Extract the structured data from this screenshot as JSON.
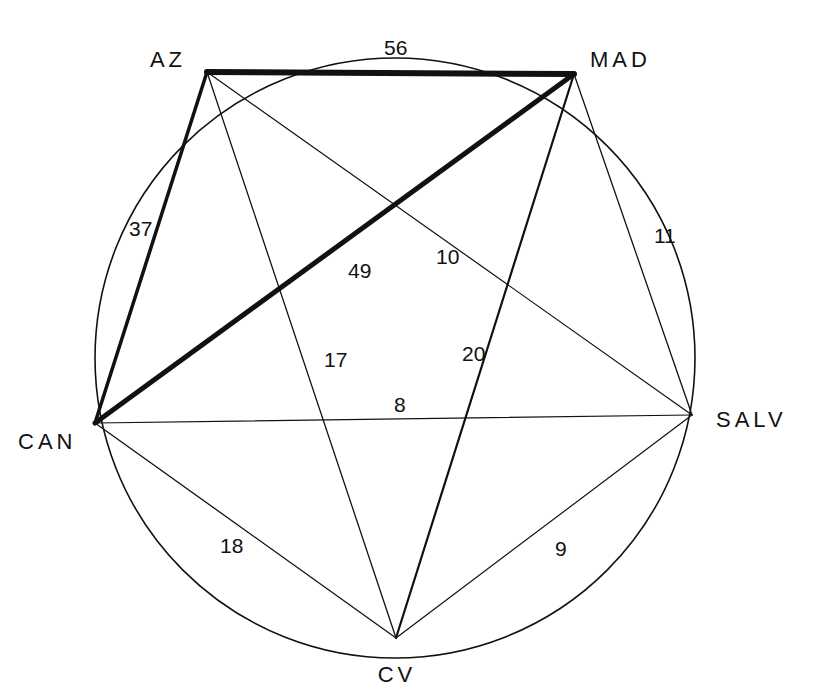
{
  "diagram": {
    "type": "weighted-complete-graph",
    "circle": {
      "cx": 395,
      "cy": 358,
      "r": 300
    },
    "nodes": [
      {
        "id": "AZ",
        "label": "AZ",
        "x": 207,
        "y": 72,
        "lx": 186,
        "ly": 67,
        "anchor": "end"
      },
      {
        "id": "MAD",
        "label": "MAD",
        "x": 574,
        "y": 74,
        "lx": 590,
        "ly": 67,
        "anchor": "start"
      },
      {
        "id": "CAN",
        "label": "CAN",
        "x": 95,
        "y": 423,
        "lx": 18,
        "ly": 449,
        "anchor": "start"
      },
      {
        "id": "SALV",
        "label": "SALV",
        "x": 692,
        "y": 415,
        "lx": 716,
        "ly": 427,
        "anchor": "start"
      },
      {
        "id": "CV",
        "label": "CV",
        "x": 396,
        "y": 638,
        "lx": 397,
        "ly": 682,
        "anchor": "middle"
      }
    ],
    "edges": [
      {
        "from": "AZ",
        "to": "MAD",
        "weight": "56",
        "width": 6,
        "lx": 384,
        "ly": 55
      },
      {
        "from": "MAD",
        "to": "CAN",
        "weight": "49",
        "width": 5,
        "lx": 348,
        "ly": 278
      },
      {
        "from": "AZ",
        "to": "CAN",
        "weight": "37",
        "width": 3.5,
        "lx": 129,
        "ly": 236
      },
      {
        "from": "MAD",
        "to": "CV",
        "weight": "20",
        "width": 2.2,
        "lx": 462,
        "ly": 361
      },
      {
        "from": "CAN",
        "to": "CV",
        "weight": "18",
        "width": 1.3,
        "lx": 220,
        "ly": 553
      },
      {
        "from": "AZ",
        "to": "CV",
        "weight": "17",
        "width": 1.3,
        "lx": 324,
        "ly": 367
      },
      {
        "from": "MAD",
        "to": "SALV",
        "weight": "11",
        "width": 1.3,
        "lx": 654,
        "ly": 243
      },
      {
        "from": "AZ",
        "to": "SALV",
        "weight": "10",
        "width": 1.2,
        "lx": 436,
        "ly": 264
      },
      {
        "from": "SALV",
        "to": "CV",
        "weight": "9",
        "width": 1.2,
        "lx": 555,
        "ly": 556
      },
      {
        "from": "CAN",
        "to": "SALV",
        "weight": "8",
        "width": 1.2,
        "lx": 394,
        "ly": 412
      }
    ]
  }
}
